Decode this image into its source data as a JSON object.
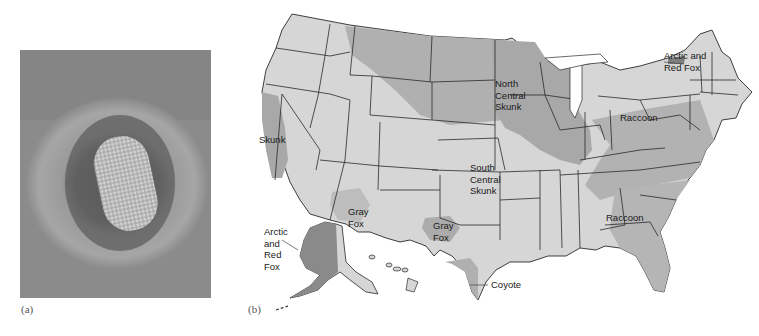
{
  "figure": {
    "panel_a": {
      "caption": "(a)",
      "description": "Electron micrograph of bullet-shaped virus particle"
    },
    "panel_b": {
      "caption": "(b)",
      "description": "Map of United States showing animal reservoir regions"
    }
  },
  "colors": {
    "background": "#ffffff",
    "micrograph_bg": "#8a8a8a",
    "map_light": "#d9d9d9",
    "map_medium": "#b3b3b3",
    "map_dark": "#8c8c8c",
    "state_border": "#2a2a2a"
  },
  "map_labels": {
    "arctic_red_fox_ne": [
      "Arctic and",
      "Red Fox"
    ],
    "north_central_skunk": [
      "North",
      "Central",
      "Skunk"
    ],
    "skunk_ca": [
      "Skunk"
    ],
    "raccoon_ne": [
      "Raccoon"
    ],
    "south_central_skunk": [
      "South",
      "Central",
      "Skunk"
    ],
    "gray_fox_az": [
      "Gray",
      "Fox"
    ],
    "gray_fox_tx": [
      "Gray",
      "Fox"
    ],
    "arctic_red_fox_ak": [
      "Arctic",
      "and",
      "Red",
      "Fox"
    ],
    "raccoon_se": [
      "Raccoon"
    ],
    "coyote": [
      "Coyote"
    ]
  }
}
